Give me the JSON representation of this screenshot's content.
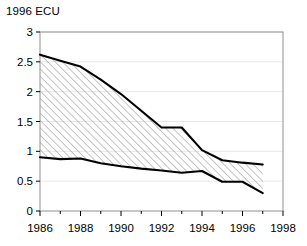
{
  "chart_data": {
    "type": "area",
    "title": "1996 ECU",
    "xlabel": "",
    "ylabel": "1996 ECU",
    "x": [
      1986,
      1987,
      1988,
      1989,
      1990,
      1991,
      1992,
      1993,
      1994,
      1995,
      1996,
      1997
    ],
    "series": [
      {
        "name": "upper bound",
        "values": [
          2.62,
          2.52,
          2.42,
          2.2,
          1.96,
          1.68,
          1.4,
          1.4,
          1.02,
          0.85,
          0.81,
          0.78
        ]
      },
      {
        "name": "lower bound",
        "values": [
          0.9,
          0.87,
          0.88,
          0.8,
          0.75,
          0.71,
          0.68,
          0.64,
          0.67,
          0.49,
          0.49,
          0.3
        ]
      }
    ],
    "fill": "hatched band between upper and lower bound",
    "xlim": [
      1986,
      1998
    ],
    "ylim": [
      0,
      3
    ],
    "y_ticks": [
      "0",
      "0.5",
      "1",
      "1.5",
      "2",
      "2.5",
      "3"
    ],
    "y_tick_values": [
      0,
      0.5,
      1,
      1.5,
      2,
      2.5,
      3
    ],
    "x_ticks": [
      "1986",
      "1988",
      "1990",
      "1992",
      "1994",
      "1996",
      "1998"
    ],
    "x_tick_values": [
      1986,
      1988,
      1990,
      1992,
      1994,
      1996,
      1998
    ],
    "x_minor_tick_values": [
      1987,
      1989,
      1991,
      1993,
      1995,
      1997
    ],
    "grid": "faint horizontal gridlines",
    "legend": "none",
    "colors": {
      "line": "#000000",
      "grid": "#e8e8e8",
      "frame": "#808080",
      "hatch": "#888888",
      "background": "#ffffff"
    }
  }
}
